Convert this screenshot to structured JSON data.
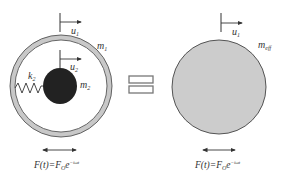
{
  "left_system": {
    "outer_mass_label": "m",
    "outer_mass_sub": "1",
    "inner_mass_label": "m",
    "inner_mass_sub": "2",
    "spring_label": "k",
    "spring_sub": "2",
    "disp_outer_label": "u",
    "disp_outer_sub": "1",
    "disp_inner_label": "u",
    "disp_inner_sub": "2",
    "force_text": "F(t)=F",
    "force_sub": "O",
    "force_exp_base": "e",
    "force_exp": "−iωt"
  },
  "equivalence_symbol": "=",
  "right_system": {
    "mass_label": "m",
    "mass_sub": "eff",
    "disp_label": "u",
    "disp_sub": "1",
    "force_text": "F(t)=F",
    "force_sub": "O",
    "force_exp_base": "e",
    "force_exp": "−iωt"
  },
  "colors": {
    "ring_fill": "#c8c8c8",
    "ring_stroke": "#555555",
    "inner_mass": "#222222",
    "effective_mass": "#cccccc",
    "line": "#333333"
  }
}
